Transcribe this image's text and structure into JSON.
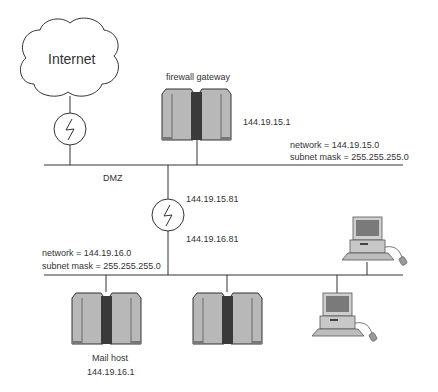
{
  "internet": {
    "label": "Internet"
  },
  "firewall": {
    "label": "firewall gateway",
    "ip": "144.19.15.1"
  },
  "dmz": {
    "label": "DMZ",
    "network": "network = 144.19.15.0",
    "subnet": "subnet mask = 255.255.255.0"
  },
  "router": {
    "ip_upper": "144.19.15.81",
    "ip_lower": "144.19.16.81"
  },
  "lan": {
    "network": "network = 144.19.16.0",
    "subnet": "subnet mask = 255.255.255.0"
  },
  "mail_host": {
    "label": "Mail host",
    "ip": "144.19.16.1"
  },
  "colors": {
    "line": "#333333",
    "server_light": "#b5b5b5",
    "server_dark": "#3a3a3a",
    "monitor": "#777777"
  }
}
